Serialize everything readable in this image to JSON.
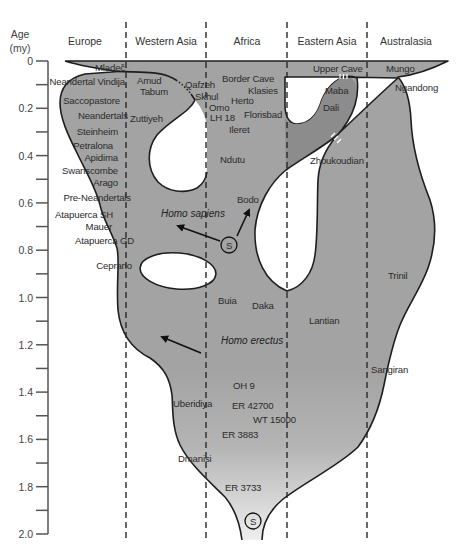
{
  "axis": {
    "title_line1": "Age",
    "title_line2": "(my)",
    "ticks": [
      "0",
      "0.2",
      "0.4",
      "0.6",
      "0.8",
      "1.0",
      "1.2",
      "1.4",
      "1.6",
      "1.8",
      "2.0"
    ]
  },
  "regions": [
    "Europe",
    "Western Asia",
    "Africa",
    "Eastern Asia",
    "Australasia"
  ],
  "sites": {
    "europe": [
      "Mladeč",
      "Neandertal Vindija",
      "Saccopastore",
      "Neandertals",
      "Steinheim",
      "Petralona",
      "Apidima",
      "Swanscombe",
      "Arago",
      "Pre-Neandertals",
      "Atapuerca SH",
      "Mauer",
      "Atapuerca GD",
      "Ceprano"
    ],
    "western_asia": [
      "Amud",
      "Tabum",
      "Zuttiyeh",
      "Qafzeh",
      "Skhul",
      "Uberidiya",
      "Dmanisi"
    ],
    "africa": [
      "Border Cave",
      "Klasies",
      "Herto",
      "Omo",
      "LH 18",
      "Florisbad",
      "Ileret",
      "Ndutu",
      "Bodo",
      "Buia",
      "Daka",
      "OH 9",
      "ER 42700",
      "WT 15000",
      "ER 3883",
      "ER 3733"
    ],
    "eastern_asia": [
      "Upper Cave",
      "Maba",
      "Dali",
      "Zhoukoudian",
      "Lantian"
    ],
    "australasia": [
      "Mungo",
      "Ngandong",
      "Trinil",
      "Sangiran"
    ]
  },
  "annotations": {
    "homo_sapiens": "Homo sapiens",
    "homo_erectus": "Homo erectus",
    "speciation_marker": "S"
  },
  "colors": {
    "population_fill": "#a3a3a3",
    "lobe_fill": "#8c8c8c",
    "outline": "#1e1e1e",
    "gap_fill": "#ffffff"
  }
}
